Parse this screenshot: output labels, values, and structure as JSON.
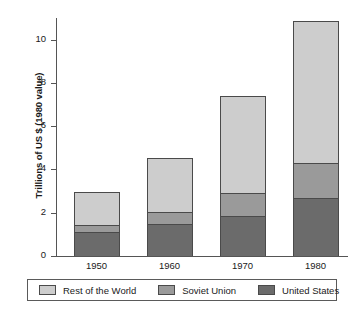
{
  "chart_data": {
    "type": "bar",
    "stacked": true,
    "title": "",
    "xlabel": "",
    "ylabel": "Trillions of US $ (1980 value)",
    "categories": [
      "1950",
      "1960",
      "1970",
      "1980"
    ],
    "series": [
      {
        "name": "United States",
        "color": "#6b6b6b",
        "values": [
          1.1,
          1.5,
          1.85,
          2.7
        ]
      },
      {
        "name": "Soviet Union",
        "color": "#9a9a9a",
        "values": [
          0.35,
          0.55,
          1.05,
          1.6
        ]
      },
      {
        "name": "Rest of the World",
        "color": "#cdcdcd",
        "values": [
          1.5,
          2.5,
          4.5,
          6.55
        ]
      }
    ],
    "totals": [
      2.95,
      4.55,
      7.4,
      10.85
    ],
    "ylim": [
      0,
      11
    ],
    "yticks": [
      0,
      2,
      4,
      6,
      8,
      10
    ],
    "ytick_labels": [
      "0",
      "2",
      "4",
      "6",
      "8",
      "10"
    ],
    "grid": false,
    "legend_position": "bottom",
    "legend_order": [
      "Rest of the World",
      "Soviet Union",
      "United States"
    ]
  },
  "axis": {
    "y_title": "Trillions of US $ (1980 value)",
    "tick_labels": [
      "10",
      "8",
      "6",
      "4",
      "2",
      "0"
    ]
  },
  "legend": {
    "items": [
      {
        "label": "Rest of the World",
        "color": "#cdcdcd"
      },
      {
        "label": "Soviet Union",
        "color": "#9a9a9a"
      },
      {
        "label": "United States",
        "color": "#6b6b6b"
      }
    ]
  }
}
